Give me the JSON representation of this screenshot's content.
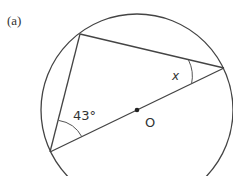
{
  "figure": {
    "part_label": "(a)",
    "circle": {
      "center_label": "O"
    },
    "angles": {
      "known": "43°",
      "unknown": "x"
    }
  },
  "colors": {
    "line": "#444444",
    "text": "#333333",
    "background": "#ffffff"
  }
}
